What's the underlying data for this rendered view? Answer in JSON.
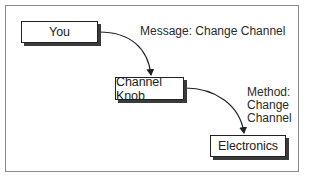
{
  "diagram": {
    "nodes": [
      {
        "id": "you",
        "label": "You"
      },
      {
        "id": "channel_knob",
        "label": "Channel Knob"
      },
      {
        "id": "electronics",
        "label": "Electronics"
      }
    ],
    "edges": [
      {
        "from": "you",
        "to": "channel_knob",
        "label": "Message: Change Channel"
      },
      {
        "from": "channel_knob",
        "to": "electronics",
        "label_lines": [
          "Method:",
          "Change",
          "Channel"
        ]
      }
    ]
  }
}
